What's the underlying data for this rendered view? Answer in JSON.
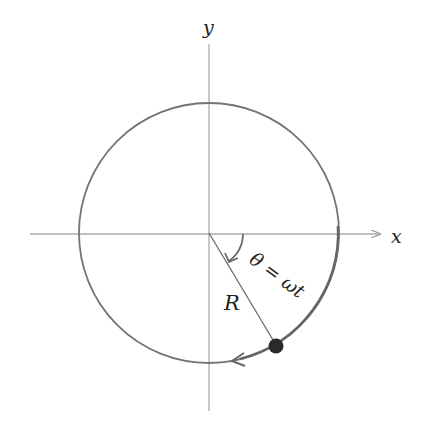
{
  "diagram": {
    "labels": {
      "y_axis": "y",
      "x_axis": "x",
      "radius": "R",
      "angle": "θ = ωt"
    },
    "geometry": {
      "center": [
        209,
        233
      ],
      "radius": 130,
      "particle_angle_deg": 60
    },
    "colors": {
      "axis": "#a8a8a8",
      "circle": "#6e6e6e",
      "arrow": "#6e6e6e",
      "particle": "#2a2a2a",
      "text": "#222222"
    }
  }
}
